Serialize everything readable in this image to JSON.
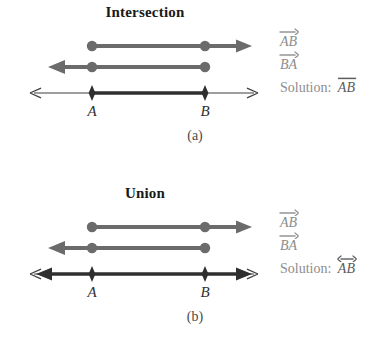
{
  "figures": [
    {
      "id": "a",
      "title": "Intersection",
      "caption": "(a)",
      "point_labels": {
        "left": "A",
        "right": "B"
      },
      "rows": [
        {
          "name": "ray-ab",
          "label": "AB",
          "accent": "right-arrow",
          "direction": "right",
          "endpoint": "A",
          "color": "#6b6b6b"
        },
        {
          "name": "ray-ba",
          "label": "BA",
          "accent": "right-arrow",
          "direction": "left",
          "endpoint": "B",
          "color": "#6b6b6b"
        },
        {
          "name": "solution-line",
          "label_prefix": "Solution:",
          "label": "AB",
          "accent": "overbar",
          "color": "#3a3a3a"
        }
      ]
    },
    {
      "id": "b",
      "title": "Union",
      "caption": "(b)",
      "point_labels": {
        "left": "A",
        "right": "B"
      },
      "rows": [
        {
          "name": "ray-ab",
          "label": "AB",
          "accent": "right-arrow",
          "direction": "right",
          "endpoint": "A",
          "color": "#6b6b6b"
        },
        {
          "name": "ray-ba",
          "label": "BA",
          "accent": "right-arrow",
          "direction": "left",
          "endpoint": "B",
          "color": "#6b6b6b"
        },
        {
          "name": "solution-line",
          "label_prefix": "Solution:",
          "label": "AB",
          "accent": "double-arrow",
          "color": "#3a3a3a"
        }
      ]
    }
  ],
  "geometry": {
    "point_a_x": 92,
    "point_b_x": 205,
    "axis_left_x": 30,
    "axis_right_x": 258
  },
  "colors": {
    "ray": "#6b6b6b",
    "axis": "#3f3f3f",
    "solution": "#2f2f2f",
    "label_gray": "#8d8d8d",
    "title": "#1a1a1a",
    "background": "#ffffff"
  }
}
